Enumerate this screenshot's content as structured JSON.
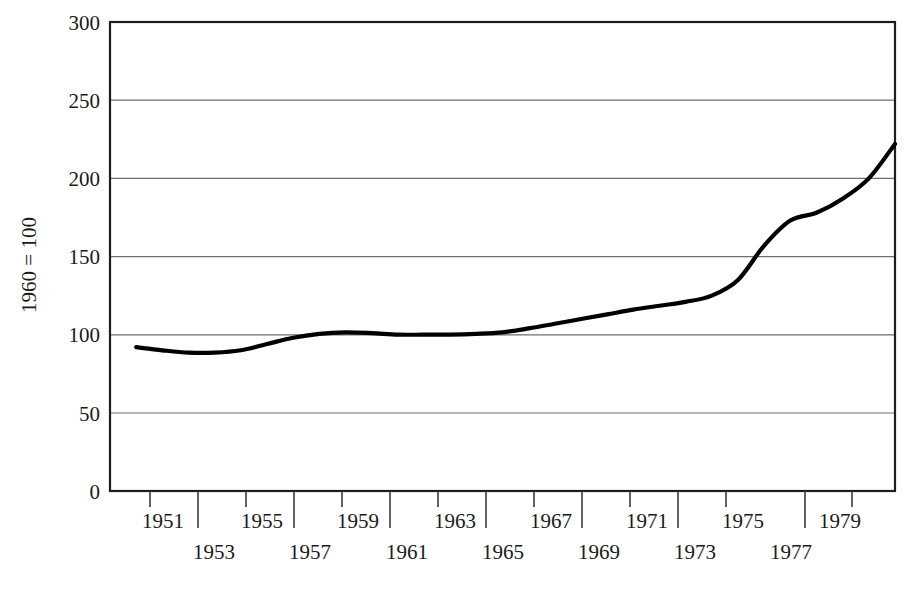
{
  "chart_data": {
    "type": "line",
    "title": "",
    "subtitle": "",
    "xlabel": "",
    "ylabel": "1960 = 100",
    "xlim": [
      1950,
      1980
    ],
    "ylim": [
      0,
      300
    ],
    "grid": "horizontal",
    "legend": "none",
    "y_ticks": [
      0,
      50,
      100,
      150,
      200,
      250,
      300
    ],
    "y_tick_labels": [
      "0",
      "50",
      "100",
      "150",
      "200",
      "250",
      "300"
    ],
    "x_ticks": [
      1951,
      1953,
      1955,
      1957,
      1959,
      1961,
      1963,
      1965,
      1967,
      1969,
      1971,
      1973,
      1975,
      1977,
      1979
    ],
    "x_tick_labels_upper": [
      "1951",
      "1955",
      "1959",
      "1963",
      "1967",
      "1971",
      "1975",
      "1979"
    ],
    "x_tick_labels_lower": [
      "1953",
      "1957",
      "1961",
      "1965",
      "1969",
      "1973",
      "1977"
    ],
    "series": [
      {
        "name": "index",
        "x": [
          1951,
          1952,
          1953,
          1954,
          1955,
          1956,
          1957,
          1958,
          1959,
          1960,
          1961,
          1962,
          1963,
          1964,
          1965,
          1966,
          1967,
          1968,
          1969,
          1970,
          1971,
          1972,
          1973,
          1974,
          1975,
          1976,
          1977,
          1978,
          1979,
          1980
        ],
        "values": [
          92,
          90,
          88.5,
          88.5,
          90,
          94,
          98,
          100.5,
          101.5,
          101,
          100,
          100,
          100,
          100.5,
          101.5,
          104,
          107,
          110,
          113,
          116,
          118.5,
          121,
          125,
          135,
          157,
          173,
          178,
          187,
          200,
          222
        ]
      }
    ],
    "annotations": []
  }
}
